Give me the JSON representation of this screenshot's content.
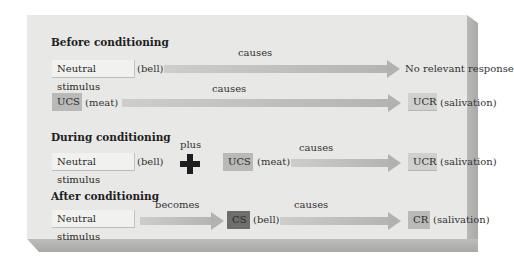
{
  "sections": {
    "before": {
      "heading": "Before conditioning",
      "row1": {
        "stimulus_box": "Neutral stimulus",
        "stimulus_note": "(bell)",
        "arrow_label": "causes",
        "result_text": "No relevant response"
      },
      "row2": {
        "stimulus_box": "UCS",
        "stimulus_note": "(meat)",
        "arrow_label": "causes",
        "result_box": "UCR",
        "result_note": "(salivation)"
      }
    },
    "during": {
      "heading": "During conditioning",
      "stimulus_box": "Neutral stimulus",
      "stimulus_note": "(bell)",
      "plus_label": "plus",
      "ucs_box": "UCS",
      "ucs_note": "(meat)",
      "arrow_label": "causes",
      "result_box": "UCR",
      "result_note": "(salivation)"
    },
    "after": {
      "heading": "After conditioning",
      "stimulus_box": "Neutral stimulus",
      "becomes_label": "becomes",
      "cs_box": "CS",
      "cs_note": "(bell)",
      "arrow_label": "causes",
      "result_box": "CR",
      "result_note": "(salivation)"
    }
  },
  "colors": {
    "panel_bg": "#e8e8e6",
    "light_box": "#f1f1ef",
    "mid_box": "#b9b9b7",
    "dark_box": "#6e6e6c",
    "arrow": "#b4b4b2",
    "plus": "#1e1e1e"
  }
}
